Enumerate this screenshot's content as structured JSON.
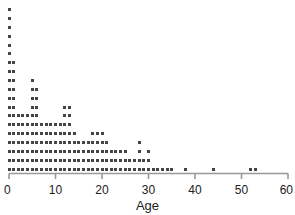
{
  "chart_data": {
    "type": "dotplot",
    "title": "",
    "subtitle": "",
    "xlabel": "Age",
    "ylabel": "",
    "xlim": [
      0,
      60
    ],
    "ylim": [
      0,
      19
    ],
    "grid": false,
    "legend": null,
    "dot_color": "#444444",
    "axis_color": "#999999",
    "text_color": "#222222",
    "background": "#ffffff",
    "x_ticks": [
      0,
      10,
      20,
      30,
      40,
      50,
      60
    ],
    "x_tick_labels": [
      "0",
      "10",
      "20",
      "30",
      "40",
      "50",
      "60"
    ],
    "categories": [
      0,
      1,
      2,
      3,
      4,
      5,
      6,
      7,
      8,
      9,
      10,
      11,
      12,
      13,
      14,
      15,
      16,
      17,
      18,
      19,
      20,
      21,
      22,
      23,
      24,
      25,
      26,
      27,
      28,
      29,
      30,
      31,
      32,
      33,
      34,
      35,
      38,
      44,
      52,
      53
    ],
    "values": [
      19,
      13,
      7,
      7,
      7,
      11,
      10,
      6,
      6,
      6,
      6,
      6,
      8,
      8,
      5,
      4,
      4,
      4,
      5,
      5,
      5,
      4,
      3,
      3,
      3,
      3,
      2,
      2,
      4,
      2,
      3,
      1,
      1,
      1,
      1,
      1,
      1,
      1,
      1,
      1
    ],
    "max_count": 19,
    "total_points": 201
  },
  "axis": {
    "x_title": "Age"
  }
}
